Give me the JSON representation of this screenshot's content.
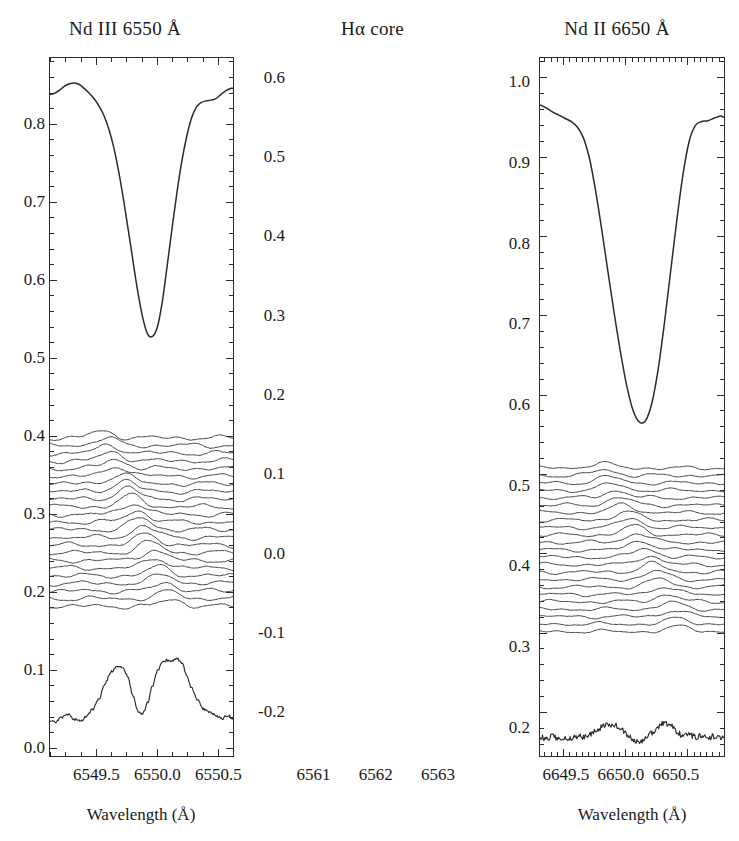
{
  "figure": {
    "kind": "stellar-spectrum-line-profile-variation",
    "panel_count": 3,
    "axis_title": "Wavelength (Å)"
  },
  "chart_data": [
    {
      "type": "line",
      "title": "Nd III 6550 Å",
      "xlabel": "Wavelength (Å)",
      "ylabel": "",
      "xlim": [
        6549.12,
        6550.62
      ],
      "ylim": [
        -0.01,
        0.885
      ],
      "xticks": [
        6549.5,
        6550.0,
        6550.5
      ],
      "xtick_labels": [
        "6549.5",
        "6550.0",
        "6550.5"
      ],
      "yticks": [
        0.0,
        0.1,
        0.2,
        0.3,
        0.4,
        0.5,
        0.6,
        0.7,
        0.8
      ],
      "ytick_labels": [
        "0.0",
        "0.1",
        "0.2",
        "0.3",
        "0.4",
        "0.5",
        "0.6",
        "0.7",
        "0.8"
      ],
      "grid": false,
      "legend": "none",
      "series": [
        {
          "name": "mean-profile",
          "role": "mean line profile",
          "x": [
            6549.12,
            6549.16,
            6549.2,
            6549.24,
            6549.28,
            6549.32,
            6549.36,
            6549.4,
            6549.44,
            6549.48,
            6549.52,
            6549.56,
            6549.6,
            6549.64,
            6549.68,
            6549.72,
            6549.76,
            6549.8,
            6549.84,
            6549.88,
            6549.92,
            6549.96,
            6550.0,
            6550.04,
            6550.08,
            6550.12,
            6550.16,
            6550.2,
            6550.24,
            6550.28,
            6550.32,
            6550.36,
            6550.4,
            6550.44,
            6550.48,
            6550.52,
            6550.56,
            6550.6,
            6550.62
          ],
          "y": [
            0.838,
            0.84,
            0.844,
            0.849,
            0.852,
            0.853,
            0.851,
            0.846,
            0.84,
            0.833,
            0.824,
            0.812,
            0.795,
            0.772,
            0.742,
            0.706,
            0.666,
            0.625,
            0.585,
            0.552,
            0.531,
            0.528,
            0.54,
            0.572,
            0.618,
            0.666,
            0.712,
            0.752,
            0.784,
            0.808,
            0.822,
            0.828,
            0.83,
            0.831,
            0.833,
            0.838,
            0.843,
            0.846,
            0.846
          ]
        },
        {
          "name": "residual-stack",
          "role": "time-series of residual spectra, offset vertically",
          "n_traces": 23,
          "y_top": 0.398,
          "y_bottom": 0.182,
          "spacing": 0.0098,
          "amplitude": 0.0115,
          "bump_start_x": 6549.55,
          "bump_end_x": 6550.12
        },
        {
          "name": "variability-amplitude",
          "role": "standard deviation / amplitude spectrum",
          "x": [
            6549.12,
            6549.17,
            6549.22,
            6549.27,
            6549.32,
            6549.37,
            6549.42,
            6549.47,
            6549.52,
            6549.57,
            6549.62,
            6549.67,
            6549.72,
            6549.76,
            6549.8,
            6549.84,
            6549.88,
            6549.92,
            6549.96,
            6550.0,
            6550.04,
            6550.08,
            6550.12,
            6550.16,
            6550.2,
            6550.24,
            6550.28,
            6550.33,
            6550.38,
            6550.43,
            6550.48,
            6550.53,
            6550.58,
            6550.62
          ],
          "y": [
            0.036,
            0.034,
            0.04,
            0.043,
            0.037,
            0.035,
            0.041,
            0.05,
            0.063,
            0.082,
            0.098,
            0.105,
            0.103,
            0.091,
            0.067,
            0.047,
            0.044,
            0.058,
            0.08,
            0.099,
            0.11,
            0.113,
            0.112,
            0.115,
            0.11,
            0.094,
            0.077,
            0.061,
            0.05,
            0.046,
            0.042,
            0.038,
            0.042,
            0.038
          ]
        }
      ]
    },
    {
      "type": "line",
      "title": "Hα core",
      "xlabel": "Wavelength (Å)",
      "ylabel": "",
      "xlim": [
        6560.62,
        6563.58
      ],
      "ylim": [
        -0.255,
        0.625
      ],
      "xticks": [
        6561,
        6562,
        6563
      ],
      "xtick_labels": [
        "6561",
        "6562",
        "6563"
      ],
      "yticks": [
        -0.2,
        -0.1,
        0.0,
        0.1,
        0.2,
        0.3,
        0.4,
        0.5,
        0.6
      ],
      "ytick_labels": [
        "-0.2",
        "-0.1",
        "0.0",
        "0.1",
        "0.2",
        "0.3",
        "0.4",
        "0.5",
        "0.6"
      ],
      "grid": false,
      "legend": "none",
      "series": [
        {
          "name": "mean-profile",
          "role": "mean line profile",
          "x": [
            6560.62,
            6560.72,
            6560.82,
            6560.92,
            6561.02,
            6561.12,
            6561.22,
            6561.32,
            6561.42,
            6561.52,
            6561.62,
            6561.72,
            6561.82,
            6561.92,
            6562.02,
            6562.12,
            6562.22,
            6562.32,
            6562.42,
            6562.52,
            6562.62,
            6562.72,
            6562.82,
            6562.92,
            6563.02,
            6563.12,
            6563.22,
            6563.32,
            6563.42,
            6563.52,
            6563.58
          ],
          "y": [
            0.566,
            0.562,
            0.557,
            0.553,
            0.549,
            0.545,
            0.538,
            0.524,
            0.497,
            0.455,
            0.405,
            0.352,
            0.3,
            0.252,
            0.21,
            0.18,
            0.166,
            0.168,
            0.19,
            0.232,
            0.29,
            0.355,
            0.42,
            0.478,
            0.52,
            0.54,
            0.545,
            0.546,
            0.549,
            0.552,
            0.55
          ]
        },
        {
          "name": "residual-stack",
          "role": "time-series of residual spectra, offset vertically",
          "n_traces": 23,
          "y_top": 0.108,
          "y_bottom": -0.098,
          "spacing": 0.0094,
          "amplitude": 0.009,
          "bump_start_x": 6561.6,
          "bump_end_x": 6562.9
        },
        {
          "name": "variability-amplitude",
          "role": "standard deviation / amplitude spectrum",
          "x": [
            6560.62,
            6560.72,
            6560.82,
            6560.92,
            6561.02,
            6561.12,
            6561.22,
            6561.32,
            6561.42,
            6561.52,
            6561.62,
            6561.72,
            6561.82,
            6561.92,
            6562.02,
            6562.12,
            6562.22,
            6562.32,
            6562.42,
            6562.52,
            6562.62,
            6562.72,
            6562.82,
            6562.92,
            6563.02,
            6563.12,
            6563.22,
            6563.32,
            6563.42,
            6563.52,
            6563.58
          ],
          "y": [
            -0.231,
            -0.233,
            -0.23,
            -0.234,
            -0.231,
            -0.233,
            -0.23,
            -0.231,
            -0.228,
            -0.224,
            -0.218,
            -0.215,
            -0.216,
            -0.221,
            -0.228,
            -0.234,
            -0.238,
            -0.233,
            -0.226,
            -0.218,
            -0.213,
            -0.216,
            -0.224,
            -0.23,
            -0.228,
            -0.231,
            -0.23,
            -0.232,
            -0.23,
            -0.231,
            -0.23
          ]
        }
      ]
    },
    {
      "type": "line",
      "title": "Nd II 6650 Å",
      "xlabel": "Wavelength (Å)",
      "ylabel": "",
      "xlim": [
        6649.22,
        6650.92
      ],
      "ylim": [
        0.165,
        1.03
      ],
      "xticks": [
        6649.5,
        6650.0,
        6650.5
      ],
      "xtick_labels": [
        "6649.5",
        "6650.0",
        "6650.5"
      ],
      "yticks": [
        0.2,
        0.3,
        0.4,
        0.5,
        0.6,
        0.7,
        0.8,
        0.9,
        1.0
      ],
      "ytick_labels": [
        "0.2",
        "0.3",
        "0.4",
        "0.5",
        "0.6",
        "0.7",
        "0.8",
        "0.9",
        "1.0"
      ],
      "grid": false,
      "legend": "none",
      "series": [
        {
          "name": "mean-profile",
          "role": "mean line profile",
          "x": [
            6649.22,
            6649.28,
            6649.34,
            6649.4,
            6649.46,
            6649.52,
            6649.58,
            6649.64,
            6649.7,
            6649.76,
            6649.82,
            6649.88,
            6649.94,
            6650.0,
            6650.06,
            6650.12,
            6650.18,
            6650.24,
            6650.3,
            6650.36,
            6650.42,
            6650.48,
            6650.54,
            6650.6,
            6650.66,
            6650.72,
            6650.78,
            6650.84,
            6650.92
          ],
          "y": [
            1.0,
            1.0,
            0.999,
            0.998,
            0.997,
            0.994,
            0.994,
            0.99,
            0.983,
            0.973,
            0.959,
            0.942,
            0.927,
            0.917,
            0.916,
            0.924,
            0.944,
            0.967,
            0.983,
            0.99,
            0.984,
            0.976,
            0.98,
            0.99,
            0.987,
            0.979,
            0.978,
            0.98,
            0.98
          ]
        },
        {
          "name": "residual-stack",
          "role": "time-series of residual spectra, offset vertically",
          "n_traces": 23,
          "y_top": 0.536,
          "y_bottom": 0.332,
          "spacing": 0.0093,
          "amplitude": 0.01,
          "bump_start_x": 6649.72,
          "bump_end_x": 6650.42
        },
        {
          "name": "variability-amplitude",
          "role": "standard deviation / amplitude spectrum",
          "x": [
            6649.22,
            6649.28,
            6649.34,
            6649.4,
            6649.46,
            6649.52,
            6649.58,
            6649.64,
            6649.7,
            6649.76,
            6649.82,
            6649.88,
            6649.94,
            6650.0,
            6650.06,
            6650.12,
            6650.18,
            6650.24,
            6650.3,
            6650.36,
            6650.42,
            6650.48,
            6650.54,
            6650.6,
            6650.66,
            6650.72,
            6650.78,
            6650.84,
            6650.92
          ],
          "y": [
            0.193,
            0.196,
            0.192,
            0.198,
            0.194,
            0.196,
            0.2,
            0.208,
            0.216,
            0.228,
            0.24,
            0.246,
            0.24,
            0.228,
            0.215,
            0.212,
            0.222,
            0.236,
            0.243,
            0.238,
            0.226,
            0.212,
            0.202,
            0.196,
            0.192,
            0.195,
            0.191,
            0.194,
            0.192
          ]
        }
      ]
    }
  ]
}
